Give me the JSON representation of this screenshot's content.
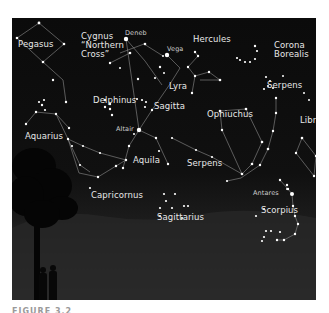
{
  "figure": {
    "caption": "FIGURE 3.2",
    "colors": {
      "sky": "#0b0b0b",
      "horizon": "#4a4a4a",
      "star": "#ffffff",
      "line": "#9a9a9a",
      "label": "#e8e8e8"
    }
  },
  "constellations": [
    {
      "id": "pegasus",
      "label": "Pegasus",
      "x": 6,
      "y": 22
    },
    {
      "id": "cygnus",
      "label": "Cygnus\n“Northern\nCross”",
      "x": 69,
      "y": 14
    },
    {
      "id": "hercules",
      "label": "Hercules",
      "x": 181,
      "y": 17
    },
    {
      "id": "corona-borealis",
      "label": "Corona\nBorealis",
      "x": 262,
      "y": 23
    },
    {
      "id": "lyra",
      "label": "Lyra",
      "x": 157,
      "y": 64
    },
    {
      "id": "serpens-caput",
      "label": "Serpens",
      "x": 255,
      "y": 63
    },
    {
      "id": "delphinus",
      "label": "Delphinus",
      "x": 81,
      "y": 78
    },
    {
      "id": "sagitta",
      "label": "Sagitta",
      "x": 142,
      "y": 84
    },
    {
      "id": "ophiuchus",
      "label": "Ophiuchus",
      "x": 195,
      "y": 92
    },
    {
      "id": "libra",
      "label": "Libra",
      "x": 288,
      "y": 98
    },
    {
      "id": "aquarius",
      "label": "Aquarius",
      "x": 13,
      "y": 114
    },
    {
      "id": "aquila",
      "label": "Aquila",
      "x": 121,
      "y": 138
    },
    {
      "id": "serpens-cauda",
      "label": "Serpens",
      "x": 175,
      "y": 141
    },
    {
      "id": "capricornus",
      "label": "Capricornus",
      "x": 79,
      "y": 173
    },
    {
      "id": "sagittarius",
      "label": "Sagittarius",
      "x": 145,
      "y": 195
    },
    {
      "id": "scorpius",
      "label": "Scorpius",
      "x": 249,
      "y": 188
    }
  ],
  "stars": [
    {
      "id": "deneb",
      "label": "Deneb",
      "x": 114,
      "y": 21
    },
    {
      "id": "vega",
      "label": "Vega",
      "x": 155,
      "y": 37
    },
    {
      "id": "altair",
      "label": "Altair",
      "x": 127,
      "y": 112
    },
    {
      "id": "antares",
      "label": "Antares",
      "x": 280,
      "y": 176
    }
  ]
}
